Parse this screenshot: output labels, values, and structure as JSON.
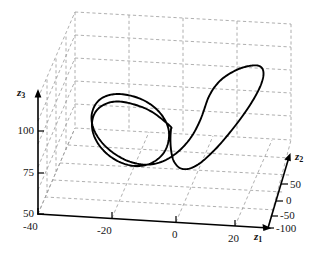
{
  "figure": {
    "kind": "3d-phase-portrait",
    "background_color": "#ffffff",
    "curve_color": "#000000",
    "axis_color": "#000000",
    "grid_color": "#9a9a9a"
  },
  "axes": {
    "x": {
      "name": "z1",
      "label_text": "z",
      "label_sub": "1",
      "ticks": [
        "-40",
        "-20",
        "0",
        "20"
      ],
      "tick_values": [
        -40,
        -20,
        0,
        20
      ],
      "range": [
        -40,
        30
      ]
    },
    "y": {
      "name": "z2",
      "label_text": "z",
      "label_sub": "2",
      "ticks": [
        "50",
        "0",
        "-50",
        "-100"
      ],
      "tick_values": [
        50,
        0,
        -50,
        -100
      ],
      "range": [
        -100,
        80
      ]
    },
    "z": {
      "name": "z3",
      "label_text": "z",
      "label_sub": "3",
      "ticks": [
        "100",
        "75",
        "50"
      ],
      "tick_values": [
        100,
        75,
        50
      ],
      "range": [
        50,
        140
      ]
    }
  },
  "chart_data": {
    "type": "line",
    "title": "",
    "xlabel": "z1",
    "ylabel": "z2",
    "zlabel": "z3",
    "xlim": [
      -40,
      30
    ],
    "ylim": [
      -100,
      80
    ],
    "zlim": [
      50,
      140
    ],
    "grid": true,
    "legend": null,
    "projection": "3d",
    "series": [
      {
        "name": "trajectory",
        "description": "Closed double-loop orbit: tight spiral on the low-z1 side opening into one large excursion toward high z1",
        "color": "#000000",
        "points_2d": [
          [
            171.0,
            127.0
          ],
          [
            163.0,
            120.0
          ],
          [
            154.5,
            113.5
          ],
          [
            145.5,
            108.5
          ],
          [
            136.0,
            105.0
          ],
          [
            126.5,
            102.5
          ],
          [
            117.5,
            101.5
          ],
          [
            109.5,
            102.5
          ],
          [
            102.5,
            105.5
          ],
          [
            97.0,
            110.0
          ],
          [
            93.5,
            116.0
          ],
          [
            92.0,
            123.0
          ],
          [
            92.5,
            130.5
          ],
          [
            95.0,
            138.0
          ],
          [
            99.0,
            145.0
          ],
          [
            104.5,
            151.5
          ],
          [
            111.0,
            157.0
          ],
          [
            118.5,
            161.5
          ],
          [
            126.5,
            164.5
          ],
          [
            135.0,
            166.0
          ],
          [
            143.5,
            165.5
          ],
          [
            151.5,
            163.0
          ],
          [
            158.5,
            158.5
          ],
          [
            164.0,
            152.5
          ],
          [
            167.5,
            145.0
          ],
          [
            169.0,
            137.0
          ],
          [
            168.5,
            129.0
          ],
          [
            165.5,
            121.0
          ],
          [
            160.5,
            113.5
          ],
          [
            154.0,
            107.0
          ],
          [
            146.0,
            101.5
          ],
          [
            137.0,
            97.5
          ],
          [
            127.5,
            95.0
          ],
          [
            118.0,
            94.0
          ],
          [
            109.5,
            95.0
          ],
          [
            102.0,
            98.0
          ],
          [
            96.5,
            103.0
          ],
          [
            93.0,
            109.5
          ],
          [
            91.5,
            117.0
          ],
          [
            92.5,
            125.5
          ],
          [
            96.0,
            134.0
          ],
          [
            101.5,
            142.0
          ],
          [
            109.0,
            149.5
          ],
          [
            118.0,
            156.0
          ],
          [
            128.0,
            161.0
          ],
          [
            139.0,
            164.0
          ],
          [
            150.0,
            164.5
          ],
          [
            161.0,
            162.0
          ],
          [
            171.0,
            157.0
          ],
          [
            180.0,
            150.0
          ],
          [
            187.5,
            142.0
          ],
          [
            193.5,
            133.5
          ],
          [
            198.0,
            125.0
          ],
          [
            201.5,
            117.0
          ],
          [
            204.0,
            110.0
          ],
          [
            206.0,
            104.0
          ],
          [
            208.0,
            98.5
          ],
          [
            210.5,
            93.5
          ],
          [
            213.5,
            88.5
          ],
          [
            217.5,
            83.5
          ],
          [
            222.0,
            79.0
          ],
          [
            227.5,
            75.0
          ],
          [
            233.5,
            71.5
          ],
          [
            240.0,
            68.5
          ],
          [
            246.5,
            66.5
          ],
          [
            252.5,
            65.5
          ],
          [
            257.5,
            65.5
          ],
          [
            261.0,
            67.0
          ],
          [
            263.0,
            70.0
          ],
          [
            263.5,
            74.5
          ],
          [
            262.5,
            80.0
          ],
          [
            260.0,
            87.0
          ],
          [
            256.0,
            95.0
          ],
          [
            251.0,
            103.5
          ],
          [
            245.0,
            112.5
          ],
          [
            238.5,
            121.5
          ],
          [
            231.5,
            130.5
          ],
          [
            224.5,
            139.0
          ],
          [
            217.5,
            147.0
          ],
          [
            210.5,
            154.0
          ],
          [
            204.0,
            160.0
          ],
          [
            198.0,
            164.5
          ],
          [
            192.5,
            167.5
          ],
          [
            187.5,
            169.0
          ],
          [
            183.0,
            169.0
          ],
          [
            179.0,
            167.5
          ],
          [
            176.0,
            164.5
          ],
          [
            173.5,
            160.5
          ],
          [
            172.0,
            155.5
          ],
          [
            171.0,
            149.5
          ],
          [
            170.5,
            143.0
          ],
          [
            170.5,
            136.0
          ],
          [
            171.0,
            129.0
          ]
        ]
      }
    ]
  }
}
